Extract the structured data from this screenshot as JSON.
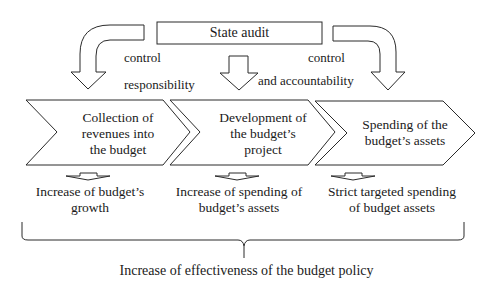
{
  "top_box": {
    "label": "State audit"
  },
  "arrow_labels": {
    "left_control": "control",
    "responsibility": "responsibility",
    "right_control": "control",
    "accountability": "and accountability"
  },
  "stages": [
    {
      "label": "Collection of\nrevenues into\nthe budget"
    },
    {
      "label": "Development of\nthe budget’s\nproject"
    },
    {
      "label": "Spending of the\nbudget’s assets"
    }
  ],
  "results": [
    {
      "label": "Increase of budget’s\ngrowth"
    },
    {
      "label": "Increase of spending of\nbudget’s assets"
    },
    {
      "label": "Strict targeted spending\nof budget assets"
    }
  ],
  "conclusion": {
    "label": "Increase of effectiveness of the budget policy"
  },
  "colors": {
    "stroke": "#2a2a2a",
    "fill": "#ffffff",
    "text": "#1a1a1a"
  }
}
